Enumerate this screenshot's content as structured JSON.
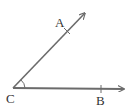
{
  "diagram": {
    "type": "geometry-angle",
    "stroke_color": "#6b6b6b",
    "label_color": "#333333",
    "vertex": {
      "label": "C",
      "x": 13,
      "y": 88
    },
    "rays": [
      {
        "name": "ray-CA",
        "end_x": 86,
        "end_y": 12,
        "point": {
          "label": "A",
          "x": 67,
          "y": 31
        }
      },
      {
        "name": "ray-CB",
        "end_x": 125,
        "end_y": 89,
        "point": {
          "label": "B",
          "x": 101,
          "y": 89
        }
      }
    ],
    "angle_marker": "arc at vertex C"
  },
  "labels": {
    "a": "A",
    "b": "B",
    "c": "C"
  }
}
